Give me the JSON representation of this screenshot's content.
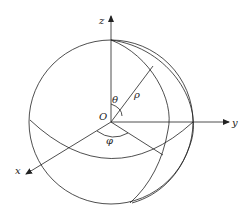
{
  "diagram": {
    "type": "spherical-coordinates",
    "labels": {
      "z_axis": "z",
      "y_axis": "y",
      "x_axis": "x",
      "origin": "O",
      "theta": "θ",
      "rho": "ρ",
      "phi": "φ"
    },
    "colors": {
      "stroke": "#222222",
      "background": "#ffffff"
    }
  }
}
